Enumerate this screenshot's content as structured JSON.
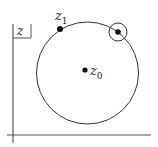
{
  "diagram": {
    "plane_label": {
      "main": "z"
    },
    "points": [
      {
        "id": "z0",
        "main": "z",
        "sub": "0",
        "x": 85,
        "y": 70,
        "role": "center"
      },
      {
        "id": "z1",
        "main": "z",
        "sub": "1",
        "x": 60,
        "y": 29,
        "role": "point-on-circle"
      },
      {
        "id": "w",
        "main": "",
        "sub": "",
        "x": 118,
        "y": 32,
        "role": "point-on-circle-with-neighborhood"
      }
    ],
    "main_circle": {
      "cx": 87.5,
      "cy": 73,
      "r": 51
    },
    "neighborhood_circle": {
      "cx": 118,
      "cy": 32,
      "r": 9
    },
    "axes": {
      "vertical": {
        "x": 13,
        "y1": 24,
        "y2": 143
      },
      "horizontal": {
        "y": 135,
        "x1": 7,
        "x2": 151
      }
    },
    "colors": {
      "stroke": "#333333",
      "point": "#111111",
      "background": "#ffffff"
    }
  }
}
